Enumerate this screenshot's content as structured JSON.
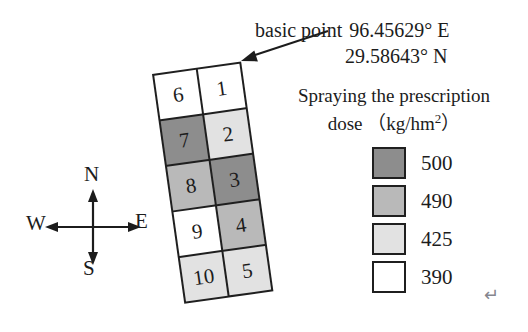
{
  "annotation": {
    "label": "basic point",
    "longitude": "96.45629°  E",
    "latitude": "29.58643°  N"
  },
  "compass": {
    "north": "N",
    "south": "S",
    "east": "E",
    "west": "W"
  },
  "grid": {
    "cells": [
      {
        "id": "6",
        "dose": 390
      },
      {
        "id": "1",
        "dose": 390
      },
      {
        "id": "7",
        "dose": 500
      },
      {
        "id": "2",
        "dose": 425
      },
      {
        "id": "8",
        "dose": 490
      },
      {
        "id": "3",
        "dose": 500
      },
      {
        "id": "9",
        "dose": 390
      },
      {
        "id": "4",
        "dose": 490
      },
      {
        "id": "10",
        "dose": 425
      },
      {
        "id": "5",
        "dose": 425
      }
    ]
  },
  "dose_colors": {
    "500": "#8d8d8d",
    "490": "#b9b9b9",
    "425": "#e2e2e2",
    "390": "#ffffff"
  },
  "legend": {
    "title_line1": "Spraying the prescription",
    "title_line2_pre": "dose （kg/hm",
    "title_line2_sup": "2",
    "title_line2_post": "）",
    "items": [
      {
        "label": "500",
        "color": "#8d8d8d"
      },
      {
        "label": "490",
        "color": "#b9b9b9"
      },
      {
        "label": "425",
        "color": "#e2e2e2"
      },
      {
        "label": "390",
        "color": "#ffffff"
      }
    ]
  },
  "return_mark": "↵"
}
